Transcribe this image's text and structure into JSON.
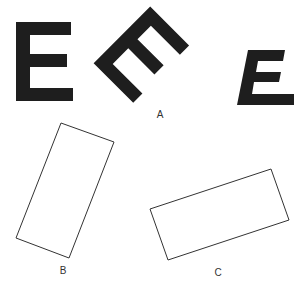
{
  "figure": {
    "colors": {
      "letter_fill": "#1e1e1e",
      "outline": "#333333",
      "background": "#ffffff"
    },
    "groups": [
      {
        "id": "A",
        "label": "A",
        "items": [
          "upright E",
          "E rotated 45 degrees",
          "italic/skewed E"
        ]
      },
      {
        "id": "B",
        "label": "B",
        "items": [
          "tall rectangle tilted"
        ]
      },
      {
        "id": "C",
        "label": "C",
        "items": [
          "wide rectangle tilted"
        ]
      }
    ]
  }
}
